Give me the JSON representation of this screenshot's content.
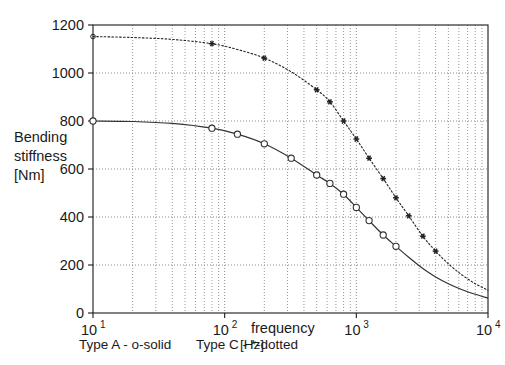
{
  "chart_data": {
    "type": "line",
    "title": "",
    "xlabel": "frequency",
    "xunit": "[Hz]",
    "ylabel_lines": [
      "Bending",
      "stiffness",
      "[Nm]"
    ],
    "ylabel": "Bending stiffness [Nm]",
    "xscale": "log",
    "yscale": "linear",
    "xlim": [
      10,
      10000
    ],
    "ylim": [
      0,
      1200
    ],
    "grid": true,
    "grid_style": "dotted",
    "legend_position": "below-axis",
    "xticks": [
      {
        "value": 10,
        "mantissa": "10",
        "exponent": "1"
      },
      {
        "value": 100,
        "mantissa": "10",
        "exponent": "2"
      },
      {
        "value": 1000,
        "mantissa": "10",
        "exponent": "3"
      },
      {
        "value": 10000,
        "mantissa": "10",
        "exponent": "4"
      }
    ],
    "yticks": [
      0,
      200,
      400,
      600,
      800,
      1000,
      1200
    ],
    "series": [
      {
        "name": "Type A",
        "legend_text": "Type A - o-solid",
        "marker": "o",
        "linestyle": "solid",
        "color": "#333333",
        "x": [
          10,
          20,
          40,
          80,
          125,
          200,
          320,
          500,
          630,
          800,
          1000,
          1250,
          1600,
          2000,
          2500,
          3200,
          4000,
          5000,
          6300,
          8000,
          10000
        ],
        "values": [
          800,
          798,
          790,
          770,
          745,
          705,
          645,
          575,
          540,
          495,
          440,
          385,
          325,
          278,
          232,
          185,
          150,
          122,
          98,
          78,
          62
        ]
      },
      {
        "name": "Type C",
        "legend_text": "Type C - *-dotted",
        "marker": "*",
        "linestyle": "dotted",
        "color": "#222222",
        "x": [
          10,
          20,
          40,
          80,
          125,
          200,
          320,
          500,
          630,
          800,
          1000,
          1250,
          1600,
          2000,
          2500,
          3200,
          4000,
          5000,
          6300,
          8000,
          10000
        ],
        "values": [
          1152,
          1148,
          1140,
          1122,
          1098,
          1062,
          1005,
          930,
          880,
          800,
          725,
          645,
          560,
          480,
          405,
          320,
          258,
          205,
          160,
          122,
          95
        ]
      }
    ]
  },
  "axes": {
    "y_label_line1": "Bending",
    "y_label_line2": "stiffness",
    "y_label_line3": "[Nm]",
    "x_label": "frequency",
    "x_unit": "[Hz]"
  },
  "legend": {
    "entry_a": "Type A - o-solid",
    "entry_c": "Type C - *-dotted"
  },
  "ticks": {
    "y": [
      "1200",
      "1000",
      "800",
      "600",
      "400",
      "200",
      "0"
    ],
    "x_mantissa": [
      "10",
      "10",
      "10",
      "10"
    ],
    "x_exponent": [
      "1",
      "2",
      "3",
      "4"
    ]
  },
  "colors": {
    "background": "#ffffff",
    "frame": "#1a1a1a",
    "grid": "#8a8a8a",
    "series_a": "#333333",
    "series_c": "#222222",
    "text": "#1a1a1a"
  }
}
